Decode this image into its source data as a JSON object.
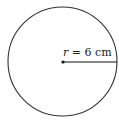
{
  "diagram": {
    "shape": "circle",
    "radius_label": {
      "variable": "r",
      "equals": " = ",
      "value": "6",
      "unit": " cm"
    },
    "colors": {
      "stroke": "#333333",
      "background": "#ffffff"
    }
  }
}
